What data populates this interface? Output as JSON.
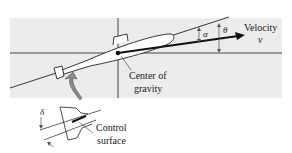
{
  "figure": {
    "type": "submarine-pitch-dynamics",
    "background_band_color": "#ececec",
    "line_color": "#222222",
    "arrow_fill_color": "#8a8a8a"
  },
  "labels": {
    "velocity": "Velocity",
    "velocity_symbol": "v",
    "alpha": "α",
    "theta": "θ",
    "center_of_gravity_line1": "Center of",
    "center_of_gravity_line2": "gravity",
    "delta": "δ",
    "control_surface_line1": "Control",
    "control_surface_line2": "surface"
  }
}
